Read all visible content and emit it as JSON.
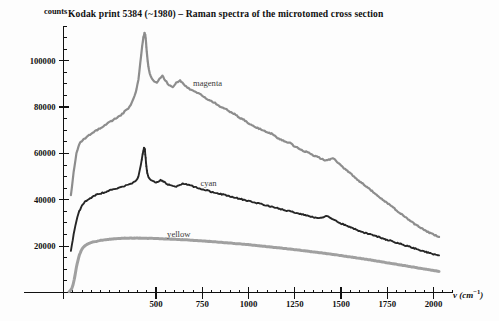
{
  "chart_data": {
    "type": "line",
    "title": "Kodak print 5384 (~1980) – Raman spectra of the microtomed cross section",
    "xlabel": "ν (cm⁻¹)",
    "ylabel": "counts",
    "xlim": [
      0,
      2100
    ],
    "ylim": [
      0,
      115000
    ],
    "grid": false,
    "legend_position": "inline-annotations",
    "xticks": [
      500,
      750,
      1000,
      1250,
      1500,
      1750,
      2000
    ],
    "xtick_labels": [
      "500",
      "750",
      "1000",
      "1250",
      "1500",
      "1750",
      "2000"
    ],
    "yticks": [
      20000,
      40000,
      60000,
      80000,
      100000
    ],
    "ytick_labels": [
      "20000",
      "40000",
      "60000",
      "80000",
      "100000"
    ],
    "series": [
      {
        "name": "magenta",
        "color": "#8d8d8d",
        "label_x": 700,
        "label_y": 90000,
        "x": [
          40,
          55,
          70,
          85,
          100,
          115,
          130,
          150,
          170,
          190,
          210,
          230,
          250,
          270,
          290,
          310,
          330,
          350,
          370,
          390,
          405,
          415,
          425,
          432,
          438,
          442,
          446,
          450,
          455,
          462,
          470,
          480,
          492,
          505,
          520,
          535,
          550,
          570,
          590,
          610,
          630,
          650,
          670,
          690,
          710,
          730,
          750,
          775,
          800,
          825,
          850,
          875,
          900,
          925,
          950,
          975,
          1000,
          1025,
          1050,
          1075,
          1100,
          1125,
          1150,
          1175,
          1200,
          1225,
          1250,
          1275,
          1300,
          1325,
          1350,
          1375,
          1400,
          1420,
          1440,
          1455,
          1470,
          1490,
          1510,
          1540,
          1570,
          1600,
          1640,
          1680,
          1720,
          1760,
          1800,
          1840,
          1880,
          1920,
          1960,
          2000,
          2030
        ],
        "y": [
          42000,
          52000,
          60000,
          64000,
          65500,
          66500,
          67500,
          68500,
          69500,
          70500,
          71500,
          72500,
          73500,
          74500,
          75500,
          76500,
          78000,
          79500,
          82000,
          86000,
          92000,
          99000,
          106000,
          110000,
          112000,
          111000,
          108000,
          104000,
          100000,
          96000,
          93500,
          92000,
          91000,
          90500,
          92500,
          93500,
          91500,
          89500,
          88500,
          90500,
          91500,
          90000,
          88500,
          87500,
          87000,
          86000,
          85000,
          83500,
          82500,
          81500,
          80000,
          79500,
          78000,
          77000,
          75500,
          74500,
          73000,
          72000,
          71000,
          70000,
          69000,
          68500,
          67000,
          66000,
          65000,
          64500,
          63000,
          62000,
          61000,
          60500,
          59000,
          58500,
          57500,
          57000,
          57500,
          58000,
          57000,
          55500,
          54000,
          52000,
          50000,
          48000,
          45500,
          43000,
          40500,
          38000,
          35500,
          33000,
          30500,
          28500,
          26500,
          25000,
          24000
        ],
        "markers_region": [
          415,
          460
        ]
      },
      {
        "name": "cyan",
        "color": "#262626",
        "label_x": 740,
        "label_y": 47000,
        "x": [
          40,
          55,
          70,
          85,
          100,
          115,
          130,
          150,
          170,
          190,
          210,
          230,
          250,
          270,
          290,
          310,
          330,
          350,
          370,
          390,
          405,
          418,
          428,
          435,
          440,
          444,
          448,
          453,
          460,
          470,
          482,
          495,
          510,
          525,
          540,
          555,
          570,
          590,
          610,
          630,
          650,
          670,
          690,
          710,
          730,
          750,
          775,
          800,
          825,
          850,
          875,
          900,
          925,
          950,
          975,
          1000,
          1025,
          1050,
          1075,
          1100,
          1125,
          1150,
          1175,
          1200,
          1225,
          1250,
          1275,
          1300,
          1325,
          1350,
          1380,
          1400,
          1420,
          1440,
          1460,
          1480,
          1510,
          1540,
          1570,
          1600,
          1640,
          1680,
          1720,
          1760,
          1800,
          1840,
          1880,
          1920,
          1960,
          2000,
          2030
        ],
        "y": [
          18000,
          25000,
          31000,
          35000,
          37500,
          39000,
          40000,
          41000,
          41800,
          42500,
          43000,
          43500,
          44000,
          44500,
          45000,
          45500,
          46000,
          46500,
          47000,
          48000,
          50000,
          55000,
          60000,
          62500,
          61500,
          58000,
          54500,
          51500,
          49500,
          48500,
          48000,
          47500,
          47500,
          48500,
          48000,
          47000,
          46500,
          46000,
          45800,
          46500,
          47000,
          46500,
          46000,
          45500,
          45000,
          44500,
          44000,
          43500,
          43000,
          42500,
          42000,
          41500,
          41000,
          40500,
          40000,
          39500,
          39000,
          38500,
          38000,
          37500,
          37000,
          36500,
          36000,
          35500,
          35000,
          34500,
          34000,
          33500,
          33000,
          32500,
          32000,
          32500,
          33000,
          32500,
          31500,
          30500,
          29500,
          28500,
          27500,
          26500,
          25500,
          24500,
          23500,
          22500,
          21500,
          20500,
          19500,
          18500,
          17500,
          16500,
          16000
        ],
        "markers_region": [
          418,
          455
        ]
      },
      {
        "name": "yellow",
        "color": "#a0a0a0",
        "label_x": 560,
        "label_y": 25000,
        "x": [
          30,
          38,
          45,
          52,
          58,
          64,
          70,
          78,
          86,
          95,
          105,
          118,
          132,
          150,
          170,
          195,
          220,
          250,
          285,
          320,
          360,
          400,
          450,
          500,
          560,
          620,
          680,
          740,
          800,
          860,
          920,
          980,
          1040,
          1100,
          1160,
          1220,
          1280,
          1340,
          1400,
          1460,
          1520,
          1580,
          1640,
          1700,
          1760,
          1820,
          1880,
          1940,
          2000,
          2030
        ],
        "y": [
          400,
          900,
          1800,
          3400,
          5600,
          8200,
          11000,
          13800,
          16200,
          18000,
          19300,
          20300,
          21000,
          21600,
          22000,
          22400,
          22700,
          23000,
          23200,
          23400,
          23500,
          23500,
          23400,
          23300,
          23100,
          22900,
          22600,
          22300,
          22000,
          21600,
          21200,
          20800,
          20300,
          19800,
          19300,
          18800,
          18200,
          17600,
          17000,
          16400,
          15700,
          15000,
          14300,
          13500,
          12700,
          11900,
          11100,
          10300,
          9500,
          9100
        ],
        "markers_region": null
      }
    ]
  },
  "annotations": {
    "magenta_label": "magenta",
    "cyan_label": "cyan",
    "yellow_label": "yellow"
  }
}
